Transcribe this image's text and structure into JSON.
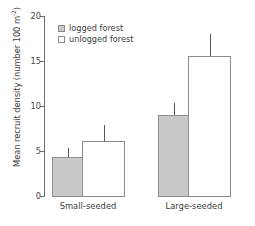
{
  "chart_data": {
    "type": "bar",
    "title": "",
    "subtitle": "",
    "xlabel": "",
    "ylabel": "Mean recruit density (number 100 m",
    "ylabel_sup": "-2",
    "ylabel_suffix": ")",
    "categories": [
      "Small-seeded",
      "Large-seeded"
    ],
    "ylim": [
      0,
      20
    ],
    "yticks": [
      0,
      5,
      10,
      15,
      20
    ],
    "ytick_labels": [
      "0",
      "5",
      "10",
      "15",
      "20"
    ],
    "grid": false,
    "legend_position": "upper-left-inside",
    "series": [
      {
        "name": "logged forest",
        "color": "#c9c9c9",
        "edge_color": "#8f8f8f",
        "values": [
          4.4,
          9.1
        ],
        "err_low": [
          3.7,
          7.9
        ],
        "err_high": [
          5.3,
          10.3
        ]
      },
      {
        "name": "unlogged forest",
        "color": "#ffffff",
        "edge_color": "#8a8a8a",
        "values": [
          6.2,
          15.7
        ],
        "err_low": [
          4.8,
          13.5
        ],
        "err_high": [
          7.9,
          18.0
        ]
      }
    ]
  },
  "legend": {
    "items": [
      {
        "label": "logged forest",
        "swatch": "logged"
      },
      {
        "label": "unlogged forest",
        "swatch": "unlogged"
      }
    ]
  },
  "axis": {
    "y_title_main": "Mean recruit density (number 100 m",
    "y_title_sup": "-2",
    "y_title_end": ")"
  }
}
